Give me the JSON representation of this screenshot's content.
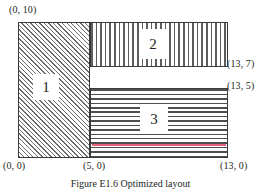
{
  "figure": {
    "caption": "Figure E1.6  Optimized layout",
    "regions": [
      {
        "id": "1",
        "label": "1",
        "fill": "diagonal-hatch"
      },
      {
        "id": "2",
        "label": "2",
        "fill": "vertical-stripes"
      },
      {
        "id": "3",
        "label": "3",
        "fill": "horizontal-stripes"
      }
    ],
    "coordinates": {
      "top_left": "(0, 10)",
      "right_upper": "(13, 7)",
      "right_lower": "(13, 5)",
      "bottom_left": "(0, 0)",
      "bottom_mid": "(5, 0)",
      "bottom_right": "(13, 0)"
    },
    "colors": {
      "outline": "#3b3b3b",
      "hatch": "#6d6d6d",
      "accent_line": "#e4607a",
      "text": "#231f20",
      "background": "#ffffff"
    }
  },
  "chart_data": {
    "type": "diagram",
    "title": "Figure E1.6  Optimized layout",
    "xlabel": "",
    "ylabel": "",
    "xlim": [
      0,
      13
    ],
    "ylim": [
      0,
      10
    ],
    "grid": false,
    "annotations": [
      "(0, 10)",
      "(13, 7)",
      "(13, 5)",
      "(0, 0)",
      "(5, 0)",
      "(13, 0)"
    ],
    "rectangles": [
      {
        "name": "1",
        "x0": 0,
        "y0": 0,
        "x1": 5,
        "y1": 10,
        "width": 5,
        "height": 10,
        "area": 50,
        "pattern": "diagonal-hatch"
      },
      {
        "name": "2",
        "x0": 5,
        "y0": 7,
        "x1": 13,
        "y1": 10,
        "width": 8,
        "height": 3,
        "area": 24,
        "pattern": "vertical-stripes"
      },
      {
        "name": "3",
        "x0": 5,
        "y0": 0,
        "x1": 13,
        "y1": 5,
        "width": 8,
        "height": 5,
        "area": 40,
        "pattern": "horizontal-stripes"
      }
    ]
  }
}
